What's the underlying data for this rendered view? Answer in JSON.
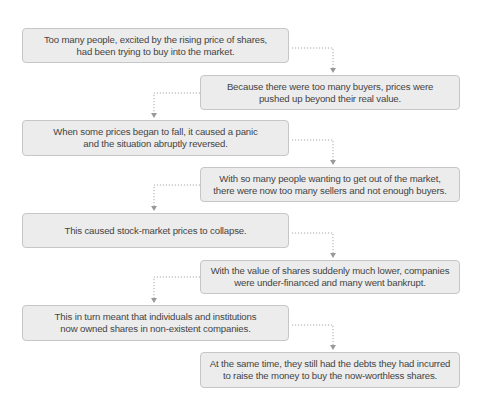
{
  "diagram": {
    "type": "flowchart",
    "colors": {
      "box_fill": "#ececec",
      "box_border": "#c6c6c6",
      "text": "#444444",
      "connector": "#a8a8a8"
    },
    "steps": [
      {
        "lines": [
          "Too many people, excited by the rising price of shares,",
          "had been trying to buy into the market."
        ]
      },
      {
        "lines": [
          "Because there were too many buyers, prices were",
          "pushed up beyond their real value."
        ]
      },
      {
        "lines": [
          "When some prices began to fall, it caused a panic",
          "and the situation abruptly reversed."
        ]
      },
      {
        "lines": [
          "With so many people wanting to get out of the market,",
          "there were now too many sellers and not enough buyers."
        ]
      },
      {
        "lines": [
          "This caused stock-market prices to collapse."
        ]
      },
      {
        "lines": [
          "With the value of shares suddenly much lower, companies",
          "were under-financed and many went bankrupt."
        ]
      },
      {
        "lines": [
          "This in turn meant that individuals and institutions",
          "now owned shares in non-existent companies."
        ]
      },
      {
        "lines": [
          "At the same time, they still had the debts they had incurred",
          "to raise the money to buy the now-worthless shares."
        ]
      }
    ],
    "connectors": [
      {
        "from": 0,
        "to": 1,
        "style": "dotted-arrow"
      },
      {
        "from": 1,
        "to": 2,
        "style": "dotted-arrow"
      },
      {
        "from": 2,
        "to": 3,
        "style": "dotted-arrow"
      },
      {
        "from": 3,
        "to": 4,
        "style": "dotted-arrow"
      },
      {
        "from": 4,
        "to": 5,
        "style": "dotted-arrow"
      },
      {
        "from": 5,
        "to": 6,
        "style": "dotted-arrow"
      },
      {
        "from": 6,
        "to": 7,
        "style": "dotted-arrow"
      }
    ]
  }
}
